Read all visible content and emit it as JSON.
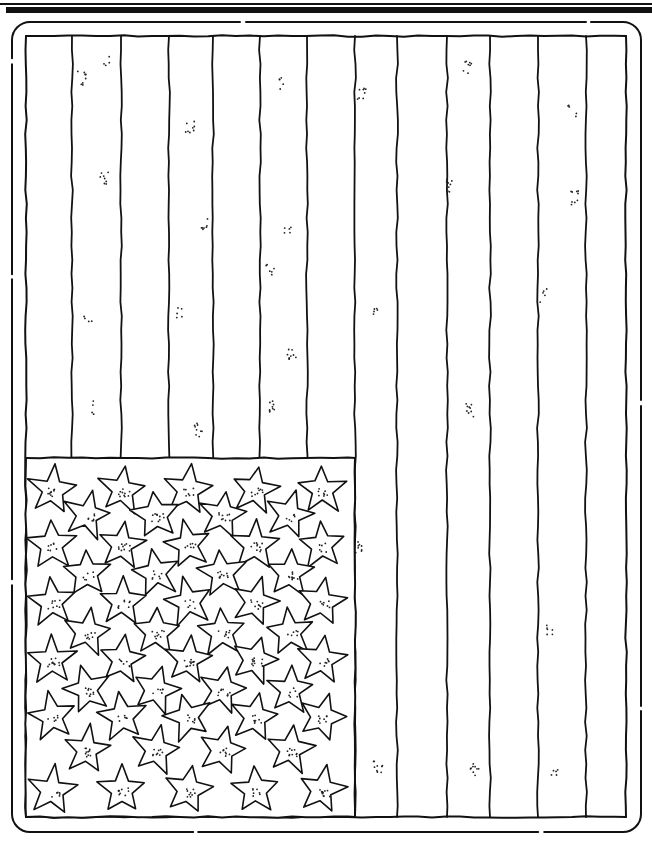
{
  "page": {
    "type": "coloring-page",
    "orientation": "vertical",
    "width": 652,
    "height": 841,
    "ink_color": "#111111",
    "paper_color": "#ffffff"
  },
  "header_rules": {
    "thin": {
      "y": 3,
      "height": 2
    },
    "thick": {
      "y": 7,
      "height": 6
    }
  },
  "frame": {
    "outer": {
      "x": 12,
      "y": 22,
      "width": 629,
      "height": 810,
      "radius": 18
    },
    "inner": {
      "x": 26,
      "y": 36,
      "width": 600,
      "height": 781
    }
  },
  "stripes": {
    "count": 13,
    "divider_x": [
      72,
      121,
      169,
      213,
      260,
      307,
      355,
      397,
      447,
      490,
      538,
      586
    ]
  },
  "canton": {
    "x": 26,
    "y": 458,
    "width": 329,
    "height": 359,
    "star_count": 50,
    "rows": [
      {
        "y": 490,
        "x": [
          52,
          122,
          188,
          255,
          322
        ]
      },
      {
        "y": 515,
        "x": [
          87,
          156,
          222,
          290
        ]
      },
      {
        "y": 545,
        "x": [
          52,
          122,
          188,
          255,
          322
        ]
      },
      {
        "y": 573,
        "x": [
          87,
          156,
          222,
          290
        ]
      },
      {
        "y": 602,
        "x": [
          52,
          122,
          188,
          255,
          322
        ]
      },
      {
        "y": 632,
        "x": [
          87,
          156,
          222,
          290
        ]
      },
      {
        "y": 660,
        "x": [
          52,
          122,
          188,
          255,
          322
        ]
      },
      {
        "y": 690,
        "x": [
          87,
          156,
          222,
          290
        ]
      },
      {
        "y": 717,
        "x": [
          52,
          122,
          188,
          255,
          322
        ]
      },
      {
        "y": 750,
        "x": [
          87,
          156,
          222,
          290
        ]
      },
      {
        "y": 790,
        "x": [
          52,
          122,
          188,
          255,
          322
        ]
      }
    ]
  },
  "stipple_clusters": [
    [
      82,
      78
    ],
    [
      107,
      60
    ],
    [
      104,
      178
    ],
    [
      88,
      317
    ],
    [
      96,
      408
    ],
    [
      190,
      127
    ],
    [
      205,
      224
    ],
    [
      178,
      313
    ],
    [
      199,
      430
    ],
    [
      283,
      84
    ],
    [
      287,
      226
    ],
    [
      270,
      271
    ],
    [
      292,
      355
    ],
    [
      270,
      408
    ],
    [
      362,
      95
    ],
    [
      373,
      308
    ],
    [
      467,
      68
    ],
    [
      451,
      186
    ],
    [
      470,
      410
    ],
    [
      572,
      110
    ],
    [
      575,
      198
    ],
    [
      543,
      296
    ],
    [
      360,
      548
    ],
    [
      378,
      768
    ],
    [
      475,
      770
    ],
    [
      555,
      775
    ],
    [
      548,
      630
    ]
  ]
}
